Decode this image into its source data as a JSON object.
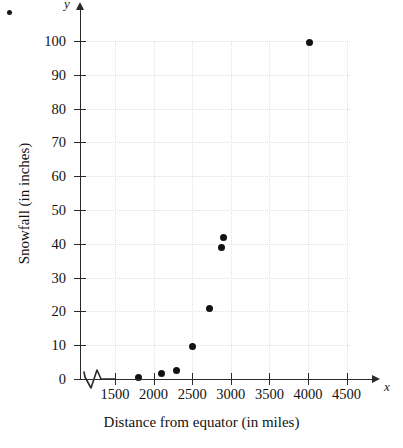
{
  "chart_data": {
    "type": "scatter",
    "title": "",
    "xlabel": "Distance from equator (in miles)",
    "ylabel": "Snowfall (in inches)",
    "x_axis_letter": "x",
    "y_axis_letter": "y",
    "xlim": [
      1250,
      4750
    ],
    "ylim": [
      0,
      105
    ],
    "x_ticks": [
      1500,
      2000,
      2500,
      3000,
      3500,
      4000,
      4500
    ],
    "x_ticklabels": [
      "1500",
      "2000",
      "2500",
      "3000",
      "3500",
      "4000",
      "4500"
    ],
    "y_ticks": [
      0,
      10,
      20,
      30,
      40,
      50,
      60,
      70,
      80,
      90,
      100
    ],
    "y_ticklabels": [
      "0",
      "10",
      "20",
      "30",
      "40",
      "50",
      "60",
      "70",
      "80",
      "90",
      "100"
    ],
    "grid": true,
    "grid_style": "dotted",
    "grid_color": "#e2e2e6",
    "axis_break_x": true,
    "legend": null,
    "marker_color": "#121212",
    "points": [
      {
        "x": 1800,
        "y": 0.3
      },
      {
        "x": 2100,
        "y": 1.5
      },
      {
        "x": 2300,
        "y": 2.5
      },
      {
        "x": 2500,
        "y": 9.5
      },
      {
        "x": 2720,
        "y": 21
      },
      {
        "x": 2880,
        "y": 39
      },
      {
        "x": 2900,
        "y": 42
      },
      {
        "x": 4020,
        "y": 99.5
      }
    ]
  }
}
